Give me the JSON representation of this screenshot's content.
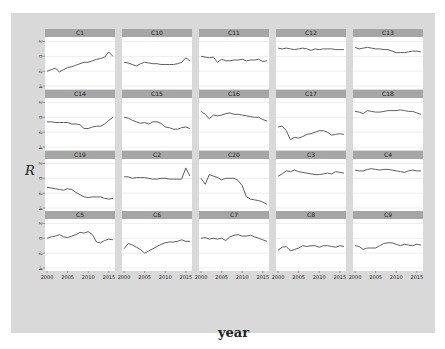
{
  "chart_data": {
    "type": "line",
    "layout": "facet_wrap",
    "ncol": 5,
    "nrow": 4,
    "xlabel": "year",
    "ylabel": "R",
    "x": [
      2000,
      2001,
      2002,
      2003,
      2004,
      2005,
      2006,
      2007,
      2008,
      2009,
      2010,
      2011,
      2012,
      2013,
      2014,
      2015,
      2016
    ],
    "x_ticks": [
      2000,
      2005,
      2010,
      2015
    ],
    "x_tick_labels": [
      "2000",
      "2005",
      "2010",
      "2015"
    ],
    "xlim": [
      1999.5,
      2016.5
    ],
    "y_ticks": [
      2,
      0,
      -2,
      -4
    ],
    "y_tick_labels": [
      "2",
      "0",
      "-2",
      "-4"
    ],
    "ylim": [
      -4.4,
      2.6
    ],
    "grid": true,
    "legend": "none",
    "colors": {
      "figure_bg": "#d9d9d9",
      "panel_bg": "#ffffff",
      "strip_bg": "#a6a6a6",
      "line": "#4d4d4d",
      "grid": "#e0e0e0",
      "text": "#222222"
    },
    "series": [
      {
        "name": "C1",
        "values": [
          -2.0,
          -1.8,
          -1.6,
          -2.1,
          -1.8,
          -1.5,
          -1.4,
          -1.2,
          -1.0,
          -0.8,
          -0.8,
          -0.6,
          -0.4,
          -0.3,
          -0.1,
          0.6,
          0.0
        ]
      },
      {
        "name": "C10",
        "values": [
          -0.8,
          -0.9,
          -1.1,
          -1.3,
          -1.0,
          -0.8,
          -0.9,
          -1.0,
          -1.0,
          -1.1,
          -1.1,
          -1.1,
          -1.1,
          -1.0,
          -0.8,
          -0.2,
          -0.6
        ]
      },
      {
        "name": "C11",
        "values": [
          0.0,
          -0.1,
          -0.2,
          -0.1,
          -0.8,
          -0.4,
          -0.6,
          -0.6,
          -0.5,
          -0.5,
          -0.4,
          -0.6,
          -0.5,
          -0.5,
          -0.4,
          -0.7,
          -0.6
        ]
      },
      {
        "name": "C12",
        "values": [
          1.1,
          1.0,
          1.1,
          1.0,
          0.9,
          1.0,
          1.1,
          1.0,
          0.8,
          1.0,
          0.9,
          1.0,
          1.0,
          1.0,
          0.9,
          0.9,
          0.9
        ]
      },
      {
        "name": "C13",
        "values": [
          1.2,
          1.0,
          1.1,
          1.2,
          1.1,
          1.0,
          1.0,
          0.9,
          0.9,
          0.7,
          0.5,
          0.5,
          0.5,
          0.6,
          0.7,
          0.7,
          0.6
        ]
      },
      {
        "name": "C14",
        "values": [
          -0.6,
          -0.6,
          -0.7,
          -0.7,
          -0.7,
          -0.7,
          -0.9,
          -0.9,
          -1.0,
          -1.5,
          -1.5,
          -1.3,
          -1.2,
          -1.2,
          -0.9,
          -0.4,
          0.0
        ]
      },
      {
        "name": "C15",
        "values": [
          0.0,
          -0.1,
          -0.4,
          -0.6,
          -0.8,
          -0.7,
          -0.9,
          -0.6,
          -0.6,
          -0.8,
          -1.3,
          -1.4,
          -1.6,
          -1.6,
          -1.4,
          -1.3,
          -1.5
        ]
      },
      {
        "name": "C16",
        "values": [
          0.8,
          0.4,
          -0.2,
          0.3,
          0.2,
          0.3,
          0.5,
          0.6,
          0.4,
          0.4,
          0.3,
          0.2,
          0.1,
          0.0,
          0.0,
          -0.3,
          -0.5
        ]
      },
      {
        "name": "C17",
        "values": [
          -1.3,
          -1.2,
          -1.8,
          -3.0,
          -2.7,
          -2.8,
          -2.6,
          -2.3,
          -2.2,
          -2.0,
          -1.8,
          -1.8,
          -2.0,
          -2.4,
          -2.3,
          -2.2,
          -2.3
        ]
      },
      {
        "name": "C18",
        "values": [
          0.8,
          0.7,
          0.5,
          0.9,
          0.8,
          0.7,
          0.7,
          0.8,
          0.9,
          0.9,
          0.9,
          1.0,
          0.9,
          0.8,
          0.8,
          0.6,
          0.4
        ]
      },
      {
        "name": "C19",
        "values": [
          -1.2,
          -1.3,
          -1.4,
          -1.5,
          -1.6,
          -1.4,
          -1.5,
          -1.9,
          -2.2,
          -2.5,
          -2.6,
          -2.5,
          -2.5,
          -2.5,
          -2.7,
          -2.8,
          -2.7
        ]
      },
      {
        "name": "C2",
        "values": [
          0.2,
          0.2,
          0.0,
          0.1,
          0.1,
          0.1,
          0.0,
          -0.1,
          -0.1,
          0.0,
          0.0,
          -0.1,
          -0.1,
          -0.1,
          -0.1,
          1.4,
          0.3
        ]
      },
      {
        "name": "C20",
        "values": [
          0.0,
          -0.8,
          0.5,
          0.3,
          0.1,
          -0.2,
          0.0,
          0.0,
          0.0,
          -0.3,
          -1.0,
          -2.5,
          -2.8,
          -2.9,
          -3.0,
          -3.2,
          -3.5
        ]
      },
      {
        "name": "C3",
        "values": [
          0.3,
          0.6,
          1.0,
          0.9,
          1.1,
          0.9,
          0.8,
          0.7,
          0.6,
          0.5,
          0.5,
          0.6,
          0.7,
          0.6,
          0.9,
          0.8,
          0.7
        ]
      },
      {
        "name": "C4",
        "values": [
          1.1,
          1.0,
          1.0,
          1.2,
          1.3,
          1.2,
          1.1,
          1.2,
          1.2,
          1.1,
          1.0,
          0.9,
          0.8,
          1.0,
          1.1,
          1.0,
          1.0
        ]
      },
      {
        "name": "C5",
        "values": [
          0.0,
          0.2,
          0.3,
          0.5,
          0.2,
          0.1,
          0.3,
          0.5,
          0.8,
          0.7,
          0.9,
          0.5,
          -0.5,
          -0.6,
          -0.3,
          -0.1,
          -0.2
        ]
      },
      {
        "name": "C6",
        "values": [
          -1.4,
          -0.7,
          -0.9,
          -1.2,
          -1.5,
          -2.0,
          -1.7,
          -1.4,
          -1.1,
          -0.8,
          -0.6,
          -0.5,
          -0.5,
          -0.4,
          -0.2,
          -0.4,
          -0.4
        ]
      },
      {
        "name": "C7",
        "values": [
          0.0,
          0.1,
          -0.1,
          0.0,
          -0.1,
          0.0,
          -0.3,
          0.2,
          0.4,
          0.5,
          0.3,
          0.3,
          0.4,
          0.2,
          0.0,
          -0.2,
          -0.4
        ]
      },
      {
        "name": "C8",
        "values": [
          -1.6,
          -1.2,
          -1.1,
          -1.7,
          -1.5,
          -1.3,
          -1.0,
          -1.1,
          -1.0,
          -1.0,
          -1.2,
          -1.0,
          -1.0,
          -1.1,
          -1.2,
          -1.0,
          -1.1
        ]
      },
      {
        "name": "C9",
        "values": [
          -1.0,
          -1.1,
          -1.5,
          -1.3,
          -1.3,
          -1.3,
          -1.0,
          -0.7,
          -0.6,
          -0.6,
          -0.8,
          -1.0,
          -0.8,
          -0.9,
          -1.0,
          -0.8,
          -0.9
        ]
      }
    ]
  }
}
